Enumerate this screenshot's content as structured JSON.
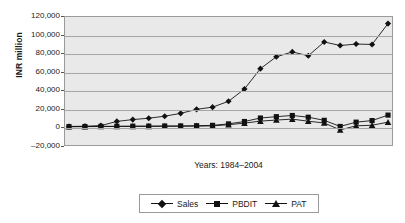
{
  "chart_data": {
    "type": "line",
    "title": "",
    "xlabel": "Years: 1984–2004",
    "ylabel": "INR million",
    "ylim": [
      -20000,
      120000
    ],
    "ytick_labels": [
      "120,000",
      "100,000",
      "80,000",
      "60,000",
      "40,000",
      "20,000",
      "0",
      "–20,000"
    ],
    "ytick_values": [
      120000,
      100000,
      80000,
      60000,
      40000,
      20000,
      0,
      -20000
    ],
    "grid": true,
    "legend_position": "bottom",
    "categories": [
      "1984",
      "1985",
      "1986",
      "1987",
      "1988",
      "1989",
      "1990",
      "1991",
      "1992",
      "1993",
      "1994",
      "1995",
      "1996",
      "1997",
      "1998",
      "1999",
      "2000",
      "2001",
      "2002",
      "2003",
      "2004"
    ],
    "series": [
      {
        "name": "Sales",
        "marker": "diamond",
        "values": [
          300,
          500,
          1200,
          5800,
          7800,
          9300,
          11500,
          14600,
          19000,
          21400,
          27800,
          41200,
          63500,
          76500,
          81800,
          77600,
          92700,
          88800,
          90400,
          90000,
          112800
        ]
      },
      {
        "name": "PBDIT",
        "marker": "square",
        "values": [
          100,
          200,
          350,
          500,
          600,
          700,
          800,
          900,
          1100,
          1500,
          3100,
          5700,
          9500,
          11000,
          12300,
          10400,
          7000,
          300,
          5000,
          6700,
          12700
        ]
      },
      {
        "name": "PAT",
        "marker": "triangle",
        "values": [
          50,
          100,
          180,
          260,
          320,
          380,
          430,
          500,
          650,
          900,
          2200,
          3900,
          6100,
          7300,
          8300,
          6000,
          4100,
          -3500,
          1000,
          1600,
          5000
        ]
      }
    ]
  },
  "legend": {
    "entries": [
      {
        "label": "Sales"
      },
      {
        "label": "PBDIT"
      },
      {
        "label": "PAT"
      }
    ]
  },
  "colors": {
    "series_line": "#111111",
    "plot_background": "#e9e9e9",
    "gridline": "#a6a6a6",
    "axis_border": "#9a9a9a",
    "page_background": "#ffffff"
  }
}
